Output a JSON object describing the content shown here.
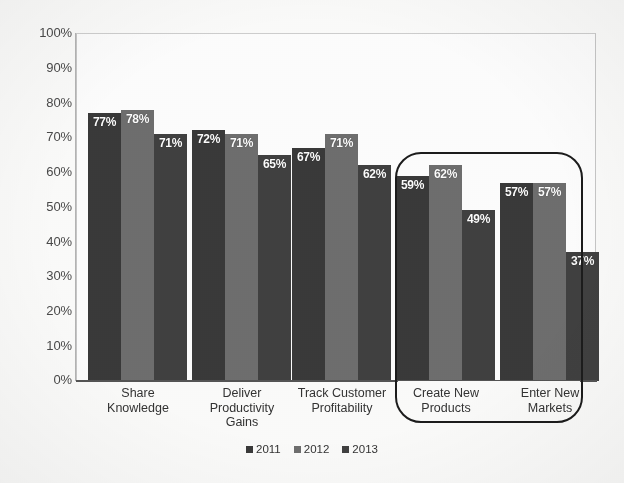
{
  "chart_data": {
    "type": "bar",
    "title": "",
    "xlabel": "",
    "ylabel": "",
    "ylim": [
      0,
      100
    ],
    "ytick_labels": [
      "100%",
      "90%",
      "80%",
      "70%",
      "60%",
      "50%",
      "40%",
      "30%",
      "20%",
      "10%",
      "0%"
    ],
    "grid": false,
    "legend_position": "bottom-center",
    "categories": [
      "Share Knowledge",
      "Deliver Productivity Gains",
      "Track Customer Profitability",
      "Create New Products",
      "Enter New Markets"
    ],
    "category_lines": [
      [
        "Share",
        "Knowledge"
      ],
      [
        "Deliver",
        "Productivity",
        "Gains"
      ],
      [
        "Track Customer",
        "Profitability"
      ],
      [
        "Create New",
        "Products"
      ],
      [
        "Enter New",
        "Markets"
      ]
    ],
    "series": [
      {
        "name": "2011",
        "color": "#3a3a3a",
        "values": [
          77,
          72,
          67,
          59,
          57
        ],
        "labels": [
          "77%",
          "72%",
          "67%",
          "59%",
          "57%"
        ]
      },
      {
        "name": "2012",
        "color": "#6f6f6f",
        "values": [
          78,
          71,
          71,
          62,
          57
        ],
        "labels": [
          "78%",
          "71%",
          "71%",
          "62%",
          "57%"
        ]
      },
      {
        "name": "2013",
        "color": "#414141",
        "values": [
          71,
          65,
          62,
          49,
          37
        ],
        "labels": [
          "71%",
          "65%",
          "62%",
          "49%",
          "37%"
        ]
      }
    ],
    "annotations": [
      {
        "name": "highlight-rounded-rect",
        "shape": "rounded-rectangle",
        "encloses": [
          "Create New Products",
          "Enter New Markets"
        ],
        "color": "#1c1c1c"
      }
    ]
  },
  "legend": {
    "items": [
      {
        "label": "2011",
        "color": "#3a3a3a"
      },
      {
        "label": "2012",
        "color": "#6f6f6f"
      },
      {
        "label": "2013",
        "color": "#414141"
      }
    ]
  }
}
